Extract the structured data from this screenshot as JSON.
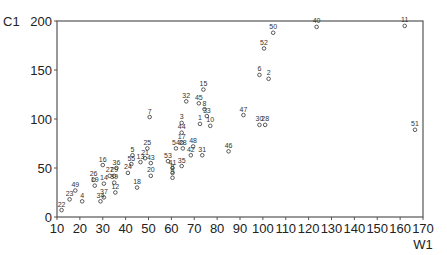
{
  "chart_data": {
    "type": "scatter",
    "title": "",
    "xlabel": "W1",
    "ylabel": "C1",
    "xlim": [
      10,
      170
    ],
    "ylim": [
      0,
      200
    ],
    "grid": false,
    "legend": null,
    "x_ticks": [
      10,
      20,
      30,
      40,
      50,
      60,
      70,
      80,
      90,
      100,
      110,
      120,
      130,
      140,
      150,
      160,
      170
    ],
    "y_ticks": [
      0,
      50,
      100,
      150,
      200
    ],
    "points": [
      {
        "label": "22",
        "x": 12,
        "y": 7
      },
      {
        "label": "23",
        "x": 15.5,
        "y": 18
      },
      {
        "label": "49",
        "x": 18,
        "y": 27
      },
      {
        "label": "4",
        "x": 21,
        "y": 16
      },
      {
        "label": "34",
        "x": 29,
        "y": 16
      },
      {
        "label": "37",
        "x": 30.5,
        "y": 20
      },
      {
        "label": "19",
        "x": 26.5,
        "y": 32
      },
      {
        "label": "26",
        "x": 26,
        "y": 38
      },
      {
        "label": "14",
        "x": 30.5,
        "y": 34
      },
      {
        "label": "16",
        "x": 30,
        "y": 53
      },
      {
        "label": "27",
        "x": 33,
        "y": 42
      },
      {
        "label": "39",
        "x": 35,
        "y": 35
      },
      {
        "label": "29",
        "x": 35,
        "y": 42
      },
      {
        "label": "36",
        "x": 36,
        "y": 50
      },
      {
        "label": "12",
        "x": 35.5,
        "y": 25
      },
      {
        "label": "24",
        "x": 41,
        "y": 45
      },
      {
        "label": "55",
        "x": 42.5,
        "y": 54
      },
      {
        "label": "5",
        "x": 43,
        "y": 63
      },
      {
        "label": "13",
        "x": 46.5,
        "y": 56
      },
      {
        "label": "18",
        "x": 45,
        "y": 30
      },
      {
        "label": "21",
        "x": 48.5,
        "y": 60
      },
      {
        "label": "25",
        "x": 49.5,
        "y": 70
      },
      {
        "label": "43",
        "x": 51,
        "y": 55
      },
      {
        "label": "20",
        "x": 51,
        "y": 42
      },
      {
        "label": "7",
        "x": 50.5,
        "y": 102
      },
      {
        "label": "54",
        "x": 62,
        "y": 70
      },
      {
        "label": "53",
        "x": 58.5,
        "y": 57
      },
      {
        "label": "41",
        "x": 60.5,
        "y": 50
      },
      {
        "label": "8",
        "x": 60.5,
        "y": 45
      },
      {
        "label": "9",
        "x": 60.5,
        "y": 40
      },
      {
        "label": "28",
        "x": 65,
        "y": 70
      },
      {
        "label": "17",
        "x": 64.5,
        "y": 76
      },
      {
        "label": "35",
        "x": 64.5,
        "y": 52
      },
      {
        "label": "42",
        "x": 68.5,
        "y": 63
      },
      {
        "label": "48",
        "x": 69.5,
        "y": 72
      },
      {
        "label": "31",
        "x": 73.5,
        "y": 63
      },
      {
        "label": "44",
        "x": 64.5,
        "y": 86
      },
      {
        "label": "3",
        "x": 64.5,
        "y": 96
      },
      {
        "label": "32",
        "x": 66.5,
        "y": 118
      },
      {
        "label": "45",
        "x": 72,
        "y": 116
      },
      {
        "label": "15",
        "x": 74,
        "y": 130
      },
      {
        "label": "8b",
        "x": 74.5,
        "y": 110
      },
      {
        "label": "1",
        "x": 72.5,
        "y": 95
      },
      {
        "label": "33",
        "x": 75.5,
        "y": 103
      },
      {
        "label": "10",
        "x": 77,
        "y": 93
      },
      {
        "label": "46",
        "x": 85,
        "y": 67
      },
      {
        "label": "47",
        "x": 91.5,
        "y": 104
      },
      {
        "label": "30",
        "x": 98.5,
        "y": 94
      },
      {
        "label": "28b",
        "x": 101,
        "y": 94
      },
      {
        "label": "6",
        "x": 98.5,
        "y": 145
      },
      {
        "label": "2",
        "x": 102.5,
        "y": 141
      },
      {
        "label": "52",
        "x": 100.5,
        "y": 172
      },
      {
        "label": "50",
        "x": 104.5,
        "y": 188
      },
      {
        "label": "40",
        "x": 123.5,
        "y": 194
      },
      {
        "label": "11",
        "x": 162,
        "y": 195
      },
      {
        "label": "51",
        "x": 166.5,
        "y": 89
      }
    ]
  }
}
